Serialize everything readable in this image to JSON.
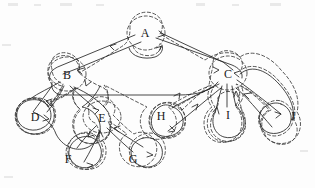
{
  "figure": {
    "kind": "tree-euler-tour-diagram",
    "background_color": "#fdfdfd",
    "ink_color": "#262626",
    "contour_color": "#3a3a3a",
    "contour_style": "dashed",
    "path_style": "solid-with-arrowheads"
  },
  "nodes": [
    {
      "id": "A",
      "label": "A",
      "x": 145,
      "y": 34,
      "role": "root",
      "depth": 0
    },
    {
      "id": "B",
      "label": "B",
      "x": 67,
      "y": 76,
      "role": "internal",
      "depth": 1
    },
    {
      "id": "C",
      "label": "C",
      "x": 228,
      "y": 75,
      "role": "internal",
      "depth": 1
    },
    {
      "id": "D",
      "label": "D",
      "x": 35,
      "y": 118,
      "role": "leaf",
      "depth": 2
    },
    {
      "id": "E",
      "label": "E",
      "x": 102,
      "y": 119,
      "role": "internal",
      "depth": 2
    },
    {
      "id": "H",
      "label": "H",
      "x": 161,
      "y": 117,
      "role": "leaf",
      "depth": 2
    },
    {
      "id": "I",
      "label": "I",
      "x": 228,
      "y": 116,
      "role": "leaf",
      "depth": 2
    },
    {
      "id": "J",
      "label": "J",
      "x": 293,
      "y": 117,
      "role": "leaf",
      "depth": 2
    },
    {
      "id": "F",
      "label": "F",
      "x": 68,
      "y": 160,
      "role": "leaf",
      "depth": 3
    },
    {
      "id": "G",
      "label": "G",
      "x": 133,
      "y": 160,
      "role": "leaf",
      "depth": 3
    }
  ],
  "edges": [
    {
      "from": "A",
      "to": "B"
    },
    {
      "from": "A",
      "to": "C"
    },
    {
      "from": "B",
      "to": "D"
    },
    {
      "from": "B",
      "to": "E"
    },
    {
      "from": "E",
      "to": "F"
    },
    {
      "from": "E",
      "to": "G"
    },
    {
      "from": "C",
      "to": "H"
    },
    {
      "from": "C",
      "to": "I"
    },
    {
      "from": "C",
      "to": "J"
    }
  ],
  "tour_order": [
    "A",
    "B",
    "D",
    "B",
    "E",
    "F",
    "E",
    "G",
    "E",
    "B",
    "A",
    "C",
    "H",
    "C",
    "I",
    "C",
    "J",
    "C",
    "A"
  ],
  "contours": [
    {
      "encloses": "A",
      "shape": "oval"
    },
    {
      "encloses": "B",
      "shape": "oval"
    },
    {
      "encloses": "C",
      "shape": "oval"
    },
    {
      "encloses": "D",
      "shape": "teardrop"
    },
    {
      "encloses": "E",
      "shape": "oval"
    },
    {
      "encloses": "F",
      "shape": "teardrop"
    },
    {
      "encloses": "G",
      "shape": "teardrop"
    },
    {
      "encloses": "H",
      "shape": "teardrop"
    },
    {
      "encloses": "I",
      "shape": "teardrop"
    },
    {
      "encloses": "J",
      "shape": "teardrop"
    },
    {
      "encloses": "subtree-B",
      "shape": "lobe"
    },
    {
      "encloses": "subtree-E",
      "shape": "lobe"
    },
    {
      "encloses": "subtree-C",
      "shape": "lobe"
    },
    {
      "encloses": "subtree-A",
      "shape": "lobe"
    }
  ]
}
